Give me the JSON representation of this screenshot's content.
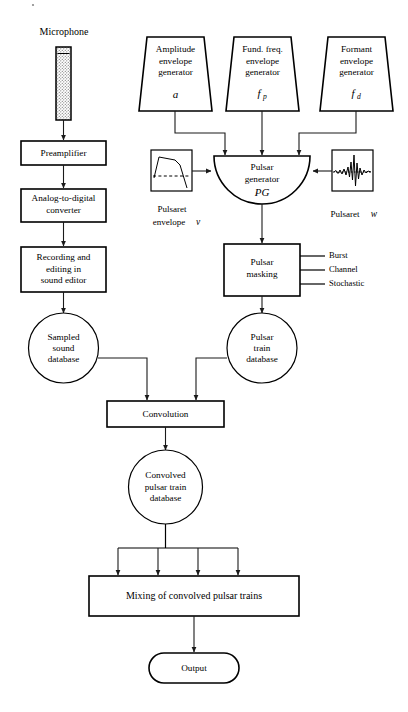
{
  "diagram": {
    "colors": {
      "stroke": "#000000",
      "edge": "#1a1a1a",
      "background": "#ffffff",
      "mic_fill": "#cccccc"
    },
    "nodes": {
      "microphone_label": "Microphone",
      "preamplifier": "Preamplifier",
      "adc_line1": "Analog-to-digital",
      "adc_line2": "converter",
      "recording_line1": "Recording and",
      "recording_line2": "editing in",
      "recording_line3": "sound editor",
      "sampled_line1": "Sampled",
      "sampled_line2": "sound",
      "sampled_line3": "database",
      "amp_gen_line1": "Amplitude",
      "amp_gen_line2": "envelope",
      "amp_gen_line3": "generator",
      "amp_gen_symbol": "a",
      "fund_gen_line1": "Fund. freq.",
      "fund_gen_line2": "envelope",
      "fund_gen_line3": "generator",
      "fund_gen_symbol": "f",
      "fund_gen_subscript": "p",
      "formant_gen_line1": "Formant",
      "formant_gen_line2": "envelope",
      "formant_gen_line3": "generator",
      "formant_gen_symbol": "f",
      "formant_gen_subscript": "d",
      "pulsar_gen_line1": "Pulsar",
      "pulsar_gen_line2": "generator",
      "pulsar_gen_symbol": "PG",
      "pulsaret_env_line1": "Pulsaret",
      "pulsaret_env_line2": "envelope",
      "pulsaret_env_symbol": "v",
      "pulsaret_w_label": "Pulsaret",
      "pulsaret_w_symbol": "w",
      "pulsar_masking_line1": "Pulsar",
      "pulsar_masking_line2": "masking",
      "masking_option_1": "Burst",
      "masking_option_2": "Channel",
      "masking_option_3": "Stochastic",
      "pulsar_train_line1": "Pulsar",
      "pulsar_train_line2": "train",
      "pulsar_train_line3": "database",
      "convolution": "Convolution",
      "convolved_line1": "Convolved",
      "convolved_line2": "pulsar train",
      "convolved_line3": "database",
      "mixing": "Mixing of convolved pulsar trains",
      "output": "Output"
    },
    "icons": {
      "microphone": "microphone-icon",
      "pulsaret_envelope": "envelope-waveform-icon",
      "pulsaret_grain": "grain-waveform-icon"
    }
  }
}
